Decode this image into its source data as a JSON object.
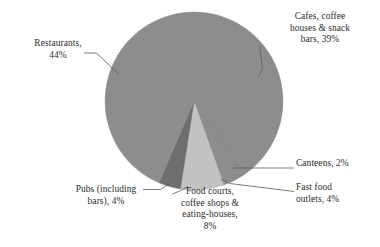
{
  "chart_data": {
    "type": "pie",
    "title": "",
    "subtitle": "",
    "xlabel": "",
    "ylabel": "",
    "legend_position": "none",
    "grid": false,
    "labels_position": "outside-with-leader-lines",
    "categories": [
      "Cafes, coffee houses & snack bars",
      "Canteens",
      "Fast food outlets",
      "Food courts, coffee shops & eating-houses",
      "Pubs (including bars)",
      "Restaurants"
    ],
    "values": [
      39,
      2,
      4,
      8,
      4,
      44
    ],
    "value_suffix": "%",
    "slices": [
      {
        "name": "Cafes, coffee houses & snack bars",
        "value": 39,
        "label": "Cafes, coffee\nhouses & snack\nbars, 39%",
        "color": "#8d8d8d"
      },
      {
        "name": "Canteens",
        "value": 2,
        "label": "Canteens, 2%",
        "color": "#8d8d8d"
      },
      {
        "name": "Fast food outlets",
        "value": 4,
        "label": "Fast food\noutlets, 4%",
        "color": "#8d8d8d"
      },
      {
        "name": "Food courts, coffee shops & eating-houses",
        "value": 8,
        "label": "Food courts,\ncoffee shops &\neating-houses,\n8%",
        "color": "#c2c2c2"
      },
      {
        "name": "Pubs (including bars)",
        "value": 4,
        "label": "Pubs (including\nbars), 4%",
        "color": "#6e6e6e"
      },
      {
        "name": "Restaurants",
        "value": 44,
        "label": "Restaurants,\n44%",
        "color": "#8d8d8d"
      }
    ],
    "colors": {
      "slice_main": "#8d8d8d",
      "slice_light": "#c2c2c2",
      "slice_dark": "#6e6e6e",
      "leader_line": "#5a5a5a",
      "text": "#2b2b2b",
      "background": "#ffffff"
    }
  }
}
